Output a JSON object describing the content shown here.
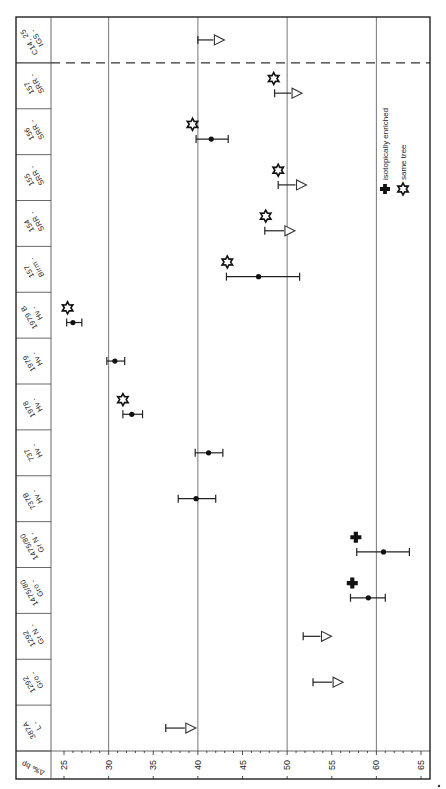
{
  "chart_data": {
    "type": "scatter",
    "orientation": "rotated 90deg (value axis runs horizontally along bottom, samples stacked vertically, labels printed rotated)",
    "title": "",
    "xlabel": "",
    "ylabel": "",
    "value_axis_label": "Δ‰ bp",
    "value_axis": {
      "min": 25,
      "max": 65,
      "ticks": [
        25,
        30,
        35,
        40,
        45,
        50,
        55,
        60,
        65
      ],
      "minor_step": 1,
      "grid": [
        30,
        40,
        50,
        60
      ]
    },
    "legend": [
      {
        "symbol": "filled-cross",
        "label": "isotopically enriched"
      },
      {
        "symbol": "open-star",
        "label": "same tree"
      }
    ],
    "separator_after_index": 0,
    "samples": [
      {
        "label": "IGS - C14, 25",
        "limit": {
          "bar_from": 40.0,
          "triangle": 42.3
        }
      },
      {
        "label": "SRR - 157",
        "star": 48.5,
        "limit": {
          "bar_from": 48.6,
          "triangle": 51.0
        }
      },
      {
        "label": "SRR - 156",
        "star": 39.4,
        "value": 41.5,
        "err": [
          39.8,
          43.4
        ]
      },
      {
        "label": "SRR - 155",
        "star": 49.0,
        "limit": {
          "bar_from": 49.0,
          "triangle": 51.5
        }
      },
      {
        "label": "SRR - 154",
        "star": 47.6,
        "limit": {
          "bar_from": 47.5,
          "triangle": 50.2
        }
      },
      {
        "label": "Birm - 157",
        "star": 43.3,
        "value": 46.8,
        "err": [
          43.2,
          51.4
        ]
      },
      {
        "label": "Hv - 1979 B",
        "star": 25.4,
        "value": 26.0,
        "err": [
          25.3,
          27.0
        ]
      },
      {
        "label": "Hv - 1979",
        "value": 30.7,
        "err": [
          29.8,
          31.8
        ]
      },
      {
        "label": "Hv - 1978",
        "star": 31.6,
        "value": 32.6,
        "err": [
          31.6,
          33.8
        ]
      },
      {
        "label": "Hv - 737",
        "value": 41.2,
        "err": [
          39.7,
          42.8
        ]
      },
      {
        "label": "Hv - 737B",
        "value": 39.8,
        "err": [
          37.8,
          42.0
        ]
      },
      {
        "label": "Gr N - 1475/80",
        "cross": 57.7,
        "value": 60.8,
        "err": [
          57.8,
          63.7
        ]
      },
      {
        "label": "Gro - 1475/80",
        "cross": 57.3,
        "value": 59.1,
        "err": [
          57.1,
          61.0
        ]
      },
      {
        "label": "Gr N - 1292",
        "limit": {
          "bar_from": 51.8,
          "triangle": 54.3
        }
      },
      {
        "label": "Gro - 1292",
        "limit": {
          "bar_from": 52.9,
          "triangle": 55.6
        }
      },
      {
        "label": "L - 387A",
        "limit": {
          "bar_from": 36.4,
          "triangle": 39.1
        }
      }
    ]
  }
}
